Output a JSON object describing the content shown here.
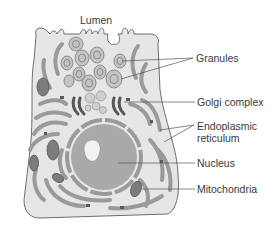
{
  "diagram": {
    "colors": {
      "cytoplasm": "#e6e6e6",
      "outline": "#6e6e6e",
      "er": "#9a9a9a",
      "er_dark": "#6a6a6a",
      "nucleus": "#a9a9a9",
      "nucleolus": "#f2f2f2",
      "granule": "#c4c4c4",
      "mitochondria": "#7c7c7c",
      "leader": "#555555",
      "text": "#3a3a3a"
    },
    "labels": {
      "lumen": "Lumen",
      "granules": "Granules",
      "golgi": "Golgi complex",
      "er_line1": "Endoplasmic",
      "er_line2": "reticulum",
      "nucleus": "Nucleus",
      "mitochondria": "Mitochondria"
    }
  }
}
